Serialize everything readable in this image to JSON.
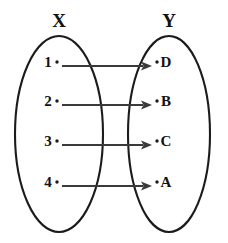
{
  "diagram": {
    "type": "mapping-diagram",
    "background_color": "#ffffff",
    "ink_color": "#1b1b1b",
    "arrow_color": "#3a3a3a",
    "sets": [
      {
        "id": "X",
        "title": "X",
        "title_x": 59,
        "title_y": 27,
        "ellipse": {
          "cx": 59,
          "cy": 134,
          "rx": 44,
          "ry": 98
        },
        "elements": [
          {
            "label": "1",
            "label_x": 48,
            "dot_x": 57,
            "y": 66
          },
          {
            "label": "2",
            "label_x": 48,
            "dot_x": 57,
            "y": 105
          },
          {
            "label": "3",
            "label_x": 48,
            "dot_x": 57,
            "y": 145
          },
          {
            "label": "4",
            "label_x": 48,
            "dot_x": 57,
            "y": 186
          }
        ]
      },
      {
        "id": "Y",
        "title": "Y",
        "title_x": 169,
        "title_y": 27,
        "ellipse": {
          "cx": 169,
          "cy": 134,
          "rx": 41,
          "ry": 98
        },
        "elements": [
          {
            "label": "D",
            "label_x": 166,
            "dot_x": 157,
            "y": 66
          },
          {
            "label": "B",
            "label_x": 166,
            "dot_x": 157,
            "y": 105
          },
          {
            "label": "C",
            "label_x": 166,
            "dot_x": 157,
            "y": 145
          },
          {
            "label": "A",
            "label_x": 166,
            "dot_x": 157,
            "y": 186
          }
        ]
      }
    ],
    "arrows": [
      {
        "from": "1",
        "to": "D",
        "x1": 62,
        "x2": 152,
        "y": 66
      },
      {
        "from": "2",
        "to": "B",
        "x1": 62,
        "x2": 152,
        "y": 105
      },
      {
        "from": "3",
        "to": "C",
        "x1": 62,
        "x2": 152,
        "y": 145
      },
      {
        "from": "4",
        "to": "A",
        "x1": 62,
        "x2": 152,
        "y": 186
      }
    ]
  }
}
